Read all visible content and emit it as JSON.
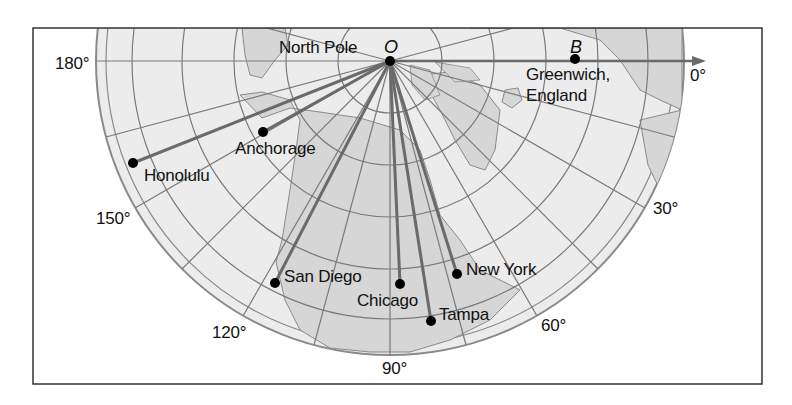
{
  "diagram": {
    "type": "polar-projection-map",
    "colors": {
      "ocean": "#ececec",
      "land": "#d6d6d6",
      "grid": "#7a7a7a",
      "route": "#6e6e6e",
      "frame": "#333333",
      "dot": "#000000",
      "text": "#111111"
    },
    "pole": {
      "label": "North Pole",
      "point_label": "O"
    },
    "reference_point": {
      "label_line1": "Greenwich,",
      "label_line2": "England",
      "point_label": "B"
    },
    "longitude_labels": {
      "deg180": "180°",
      "deg150": "150°",
      "deg120": "120°",
      "deg90": "90°",
      "deg60": "60°",
      "deg30": "30°",
      "deg0": "0°"
    },
    "cities": [
      {
        "name": "Honolulu",
        "x": 133,
        "y": 163
      },
      {
        "name": "Anchorage",
        "x": 263,
        "y": 132
      },
      {
        "name": "San Diego",
        "x": 275,
        "y": 283
      },
      {
        "name": "Chicago",
        "x": 400,
        "y": 284
      },
      {
        "name": "Tampa",
        "x": 431,
        "y": 321
      },
      {
        "name": "New York",
        "x": 457,
        "y": 274
      }
    ]
  }
}
